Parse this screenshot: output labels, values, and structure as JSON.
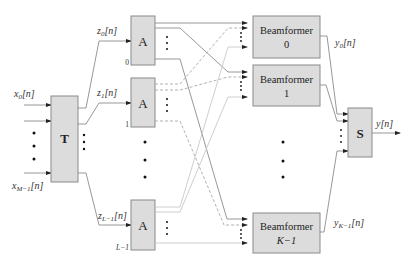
{
  "diagram": {
    "inputs": {
      "first": "x0[n]",
      "last": "xM−1[n]",
      "first_base": "x",
      "first_sub": "0",
      "first_tail": "[n]",
      "last_base": "x",
      "last_sub": "M−1",
      "last_tail": "[n]"
    },
    "transform_block": {
      "label": "T"
    },
    "channels": [
      {
        "signal_base": "z",
        "signal_sub": "0",
        "signal_tail": "[n]",
        "block_label": "A",
        "index": "0"
      },
      {
        "signal_base": "z",
        "signal_sub": "1",
        "signal_tail": "[n]",
        "block_label": "A",
        "index": "1"
      },
      {
        "signal_base": "z",
        "signal_sub": "L−1",
        "signal_tail": "[n]",
        "block_label": "A",
        "index": "L−1"
      }
    ],
    "beamformers": [
      {
        "label": "Beamformer",
        "index": "0",
        "output_base": "y",
        "output_sub": "0",
        "output_tail": "[n]"
      },
      {
        "label": "Beamformer",
        "index": "1"
      },
      {
        "label": "Beamformer",
        "index": "K−1",
        "output_base": "y",
        "output_sub": "K−1",
        "output_tail": "[n]"
      }
    ],
    "sum_block": {
      "label": "S"
    },
    "output": {
      "label": "y[n]"
    },
    "colors": {
      "block_fill": "#dcdcdc",
      "block_stroke": "#8a8a8a",
      "line": "#8c8c8c"
    }
  }
}
